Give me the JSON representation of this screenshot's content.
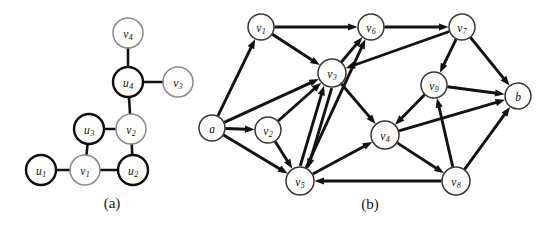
{
  "figure": {
    "width": 560,
    "height": 227,
    "background": "#ffffff"
  },
  "colors": {
    "ink": "#14110e",
    "dark_node_stroke": "#100e0c",
    "light_node_stroke": "#8c8a88",
    "plain_node_stroke": "#3a3734",
    "node_fill": "#fdfdfc",
    "caption": "#17140f"
  },
  "panels": [
    {
      "id": "panel-a",
      "caption": "(a)",
      "caption_pos": {
        "x": 112,
        "y": 203
      },
      "type": "undirected",
      "nodes": [
        {
          "id": "v4",
          "base": "v",
          "sub": "4",
          "x": 128,
          "y": 33,
          "r": 15,
          "style": "light"
        },
        {
          "id": "u4",
          "base": "u",
          "sub": "4",
          "x": 128,
          "y": 82,
          "r": 15,
          "style": "dark"
        },
        {
          "id": "v3",
          "base": "v",
          "sub": "3",
          "x": 178,
          "y": 82,
          "r": 15,
          "style": "light"
        },
        {
          "id": "u3",
          "base": "u",
          "sub": "3",
          "x": 89,
          "y": 129,
          "r": 15,
          "style": "dark"
        },
        {
          "id": "v2",
          "base": "v",
          "sub": "2",
          "x": 131,
          "y": 129,
          "r": 15,
          "style": "light"
        },
        {
          "id": "u1",
          "base": "u",
          "sub": "1",
          "x": 41,
          "y": 170,
          "r": 15,
          "style": "dark"
        },
        {
          "id": "v1",
          "base": "v",
          "sub": "1",
          "x": 85,
          "y": 170,
          "r": 15,
          "style": "light"
        },
        {
          "id": "u2",
          "base": "u",
          "sub": "2",
          "x": 133,
          "y": 170,
          "r": 15,
          "style": "dark"
        }
      ],
      "edges": [
        {
          "from": "v4",
          "to": "u4"
        },
        {
          "from": "u4",
          "to": "v3"
        },
        {
          "from": "u4",
          "to": "v2"
        },
        {
          "from": "u3",
          "to": "v2"
        },
        {
          "from": "u3",
          "to": "v1"
        },
        {
          "from": "v2",
          "to": "u2"
        },
        {
          "from": "u1",
          "to": "v1"
        },
        {
          "from": "v1",
          "to": "u2"
        }
      ]
    },
    {
      "id": "panel-b",
      "caption": "(b)",
      "caption_pos": {
        "x": 370,
        "y": 204
      },
      "type": "directed",
      "nodes": [
        {
          "id": "a",
          "base": "a",
          "sub": "",
          "x": 212,
          "y": 128,
          "r": 13,
          "style": "plain"
        },
        {
          "id": "v1",
          "base": "v",
          "sub": "1",
          "x": 261,
          "y": 27,
          "r": 13,
          "style": "plain"
        },
        {
          "id": "v2",
          "base": "v",
          "sub": "2",
          "x": 268,
          "y": 130,
          "r": 13,
          "style": "plain"
        },
        {
          "id": "v3",
          "base": "v",
          "sub": "3",
          "x": 332,
          "y": 73,
          "r": 14,
          "style": "plain"
        },
        {
          "id": "v4",
          "base": "v",
          "sub": "4",
          "x": 385,
          "y": 135,
          "r": 14,
          "style": "plain"
        },
        {
          "id": "v5",
          "base": "v",
          "sub": "5",
          "x": 300,
          "y": 181,
          "r": 14,
          "style": "plain"
        },
        {
          "id": "v6",
          "base": "v",
          "sub": "6",
          "x": 371,
          "y": 27,
          "r": 13,
          "style": "plain"
        },
        {
          "id": "v7",
          "base": "v",
          "sub": "7",
          "x": 462,
          "y": 27,
          "r": 13,
          "style": "plain"
        },
        {
          "id": "v8",
          "base": "v",
          "sub": "8",
          "x": 456,
          "y": 181,
          "r": 14,
          "style": "plain"
        },
        {
          "id": "v9",
          "base": "v",
          "sub": "9",
          "x": 434,
          "y": 85,
          "r": 13,
          "style": "plain"
        },
        {
          "id": "b",
          "base": "b",
          "sub": "",
          "x": 518,
          "y": 96,
          "r": 13,
          "style": "plain"
        }
      ],
      "edges": [
        {
          "from": "a",
          "to": "v1",
          "curve": 0
        },
        {
          "from": "a",
          "to": "v2",
          "curve": 0
        },
        {
          "from": "a",
          "to": "v3",
          "curve": 0
        },
        {
          "from": "a",
          "to": "v5",
          "curve": 0
        },
        {
          "from": "v1",
          "to": "v6",
          "curve": 0
        },
        {
          "from": "v1",
          "to": "v3",
          "curve": 0
        },
        {
          "from": "v2",
          "to": "v3",
          "curve": 0
        },
        {
          "from": "v2",
          "to": "v5",
          "curve": 0
        },
        {
          "from": "v3",
          "to": "v6",
          "curve": 0
        },
        {
          "from": "v3",
          "to": "v4",
          "curve": 0
        },
        {
          "from": "v3",
          "to": "v5",
          "curve": -4
        },
        {
          "from": "v5",
          "to": "v3",
          "curve": -4
        },
        {
          "from": "v5",
          "to": "v6",
          "curve": 0
        },
        {
          "from": "v5",
          "to": "v4",
          "curve": 0
        },
        {
          "from": "v6",
          "to": "v7",
          "curve": 0
        },
        {
          "from": "v7",
          "to": "v3",
          "curve": 0
        },
        {
          "from": "v7",
          "to": "v9",
          "curve": 0
        },
        {
          "from": "v7",
          "to": "b",
          "curve": 0
        },
        {
          "from": "v9",
          "to": "v4",
          "curve": 0
        },
        {
          "from": "v9",
          "to": "b",
          "curve": 0
        },
        {
          "from": "v4",
          "to": "v8",
          "curve": 0
        },
        {
          "from": "v4",
          "to": "b",
          "curve": 0
        },
        {
          "from": "v8",
          "to": "v5",
          "curve": 0
        },
        {
          "from": "v8",
          "to": "v9",
          "curve": 0
        },
        {
          "from": "v8",
          "to": "b",
          "curve": 0
        }
      ]
    }
  ]
}
